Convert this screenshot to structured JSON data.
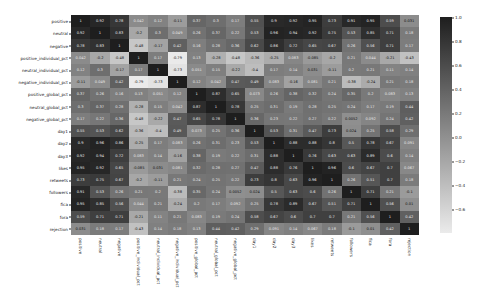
{
  "chart_data": {
    "type": "heatmap",
    "title": "",
    "xlabel": "",
    "ylabel": "",
    "colormap": "grayscale (dark = high correlation, light = low/negative)",
    "vmin": -0.8,
    "vmax": 1.0,
    "colorbar_ticks": [
      1.0,
      0.8,
      0.6,
      0.4,
      0.2,
      0.0,
      -0.2,
      -0.4,
      -0.6
    ],
    "colorbar_tick_labels": [
      "1.0",
      "0.8",
      "0.6",
      "0.4",
      "0.2",
      "0.0",
      "−0.2",
      "−0.4",
      "−0.6"
    ],
    "annotated": true,
    "labels": [
      "positive",
      "neutral",
      "negative",
      "positive_individual_pct",
      "neutral_individual_pct",
      "negative_individual_pct",
      "positive_global_pct",
      "neutral_global_pct",
      "negative_global_pct",
      "day1",
      "day2",
      "day3",
      "likes",
      "retweets",
      "followers",
      "fica",
      "fora",
      "rejection"
    ],
    "matrix": [
      [
        1,
        0.92,
        0.78,
        0.042,
        0.12,
        -0.11,
        0.37,
        0.3,
        0.17,
        0.55,
        0.9,
        0.92,
        0.95,
        0.73,
        0.91,
        0.95,
        0.59,
        0.031
      ],
      [
        0.92,
        1,
        0.83,
        -0.2,
        0.3,
        0.049,
        0.26,
        0.37,
        0.22,
        0.53,
        0.96,
        0.94,
        0.92,
        0.75,
        0.53,
        0.85,
        0.71,
        0.18
      ],
      [
        0.78,
        0.83,
        1,
        -0.48,
        -0.17,
        0.42,
        0.16,
        0.28,
        0.36,
        0.62,
        0.86,
        0.72,
        0.65,
        0.67,
        0.26,
        0.56,
        0.71,
        0.17
      ],
      [
        0.042,
        -0.2,
        -0.48,
        1,
        0.17,
        -0.79,
        0.13,
        -0.28,
        -0.48,
        -0.36,
        -0.25,
        0.083,
        -0.085,
        -0.2,
        0.21,
        0.044,
        -0.21,
        -0.43
      ],
      [
        0.12,
        0.3,
        -0.17,
        0.17,
        1,
        -0.73,
        0.051,
        0.15,
        -0.22,
        -0.4,
        0.17,
        0.14,
        0.031,
        -0.11,
        0.2,
        0.21,
        0.11,
        0.14
      ],
      [
        -0.11,
        0.049,
        0.42,
        -0.79,
        -0.73,
        1,
        0.12,
        0.042,
        0.47,
        0.49,
        0.083,
        -0.16,
        0.081,
        0.21,
        -0.38,
        -0.24,
        0.21,
        0.18
      ],
      [
        0.37,
        0.26,
        0.16,
        0.13,
        0.051,
        0.12,
        1,
        0.87,
        0.65,
        0.073,
        0.26,
        0.38,
        0.32,
        0.24,
        0.35,
        0.2,
        0.083,
        0.13
      ],
      [
        0.3,
        0.37,
        0.28,
        -0.28,
        0.15,
        0.042,
        0.87,
        1,
        0.78,
        0.25,
        0.31,
        0.19,
        0.28,
        0.25,
        0.24,
        0.17,
        0.19,
        0.44
      ],
      [
        0.17,
        0.22,
        0.36,
        -0.48,
        -0.22,
        0.47,
        0.65,
        0.78,
        1,
        0.36,
        0.23,
        0.22,
        0.27,
        0.22,
        0.0052,
        0.092,
        0.24,
        0.42
      ],
      [
        0.55,
        0.53,
        0.62,
        -0.36,
        -0.4,
        0.49,
        0.073,
        0.25,
        0.36,
        1,
        0.53,
        0.31,
        0.47,
        0.73,
        0.024,
        0.25,
        0.58,
        0.29
      ],
      [
        0.9,
        0.96,
        0.86,
        -0.25,
        0.17,
        0.083,
        0.26,
        0.31,
        0.23,
        0.53,
        1,
        0.88,
        0.88,
        0.8,
        0.5,
        0.78,
        0.67,
        0.091
      ],
      [
        0.92,
        0.94,
        0.72,
        0.083,
        0.14,
        -0.16,
        0.38,
        0.19,
        0.22,
        0.31,
        0.88,
        1,
        0.76,
        0.63,
        0.63,
        0.89,
        0.6,
        0.14
      ],
      [
        0.95,
        0.92,
        0.65,
        -0.085,
        0.031,
        0.081,
        0.32,
        0.28,
        0.27,
        0.47,
        0.88,
        0.76,
        1,
        0.96,
        0.6,
        0.67,
        0.7,
        0.067
      ],
      [
        0.73,
        0.75,
        0.67,
        -0.2,
        -0.11,
        0.21,
        0.24,
        0.25,
        0.22,
        0.73,
        0.8,
        0.63,
        0.96,
        1,
        0.26,
        0.51,
        0.7,
        0.18
      ],
      [
        0.91,
        0.53,
        0.26,
        0.21,
        0.2,
        -0.38,
        0.35,
        0.24,
        0.0052,
        0.024,
        0.5,
        0.63,
        0.6,
        0.26,
        1,
        0.71,
        0.21,
        -0.1
      ],
      [
        0.95,
        0.85,
        0.56,
        0.044,
        0.21,
        -0.24,
        0.2,
        0.17,
        0.092,
        0.25,
        0.78,
        0.89,
        0.67,
        0.51,
        0.71,
        1,
        0.56,
        0.01
      ],
      [
        0.59,
        0.71,
        0.71,
        -0.21,
        0.11,
        0.21,
        0.083,
        0.19,
        0.24,
        0.58,
        0.67,
        0.6,
        0.7,
        0.7,
        0.21,
        0.56,
        1,
        0.42
      ],
      [
        0.031,
        0.18,
        0.17,
        -0.43,
        0.14,
        0.18,
        0.13,
        0.44,
        0.42,
        0.29,
        0.091,
        0.14,
        0.067,
        0.18,
        -0.1,
        0.01,
        0.42,
        1
      ]
    ]
  }
}
